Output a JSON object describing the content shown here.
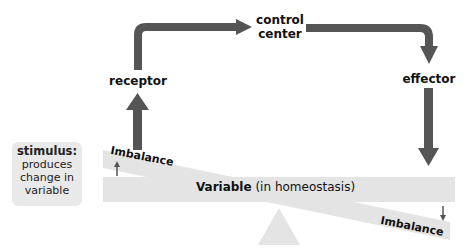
{
  "diagram": {
    "nodes": {
      "control_center": "control\ncenter",
      "control_center_line1": "control",
      "control_center_line2": "center",
      "receptor": "receptor",
      "effector": "effector"
    },
    "stimulus": {
      "title": "stimulus:",
      "line1": "produces",
      "line2": "change in",
      "line3": "variable"
    },
    "balance": {
      "variable_bold": "Variable",
      "variable_rest": " (in homeostasis)",
      "imbalance_left": "Imbalance",
      "imbalance_right": "Imbalance"
    },
    "colors": {
      "arrow": "#555555",
      "beam": "#e4e4e4",
      "fulcrum": "#e4e4e4",
      "stimulus_bg": "#e9e9e9"
    }
  }
}
